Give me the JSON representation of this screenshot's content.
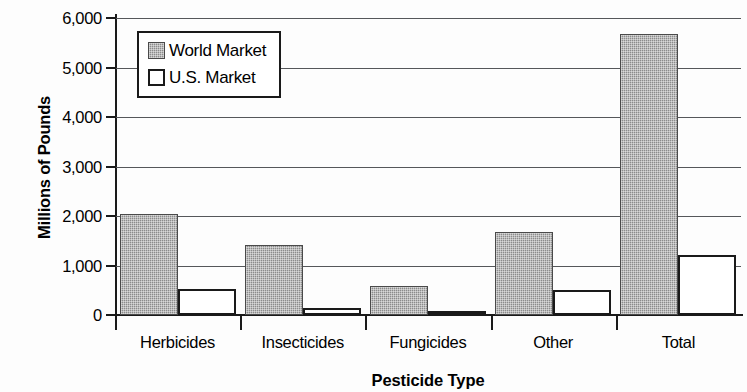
{
  "chart_data": {
    "type": "bar",
    "title": "",
    "xlabel": "Pesticide Type",
    "ylabel": "Millions of Pounds",
    "categories": [
      "Herbicides",
      "Insecticides",
      "Fungicides",
      "Other",
      "Total"
    ],
    "series": [
      {
        "name": "World Market",
        "values": [
          2050,
          1420,
          590,
          1670,
          5680
        ],
        "fill": "#8c8c8c",
        "pattern": "dithered-gray"
      },
      {
        "name": "U.S. Market",
        "values": [
          530,
          140,
          90,
          500,
          1220
        ],
        "fill": "#ffffff",
        "pattern": "outline-white"
      }
    ],
    "ylim": [
      0,
      6000
    ],
    "ytick_values": [
      6000,
      5000,
      4000,
      3000,
      2000,
      1000,
      0
    ],
    "ytick_labels": [
      "6,000",
      "5,000",
      "4,000",
      "3,000",
      "2,000",
      "1,000",
      "0"
    ],
    "grid": true,
    "grid_axis": "y",
    "legend_position": "upper-left-inside",
    "legend_entries": [
      "World Market",
      "U.S. Market"
    ],
    "axis_color": "#1a1a1a",
    "grid_color": "#55575a",
    "background": "#fdfdfd"
  }
}
